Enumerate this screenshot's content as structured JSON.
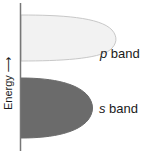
{
  "diagram": {
    "axis": {
      "label": "Energy",
      "arrow": "⟶",
      "color": "#777777"
    },
    "bands": [
      {
        "id": "p",
        "symbol": "p",
        "suffix": " band",
        "fill": "#f2f2f2",
        "stroke": "#c8c8c8",
        "position": "upper"
      },
      {
        "id": "s",
        "symbol": "s",
        "suffix": " band",
        "fill": "#6b6b6b",
        "stroke": "#6b6b6b",
        "position": "lower"
      }
    ]
  }
}
